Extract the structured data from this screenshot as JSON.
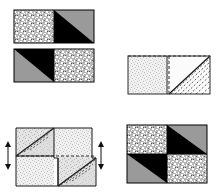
{
  "figure": {
    "background_color": "#ffffff",
    "colors": {
      "black": "#000000",
      "gray": "#9a9a9a",
      "speckle_base": "#c8c8c8",
      "speckle_dot": "#ffffff",
      "light_speckle_base": "#f2f2f2",
      "light_speckle_dot": "#c9c9c9",
      "light_gray_fill": "#dedede",
      "outline": "#000000",
      "light_outline": "#555555",
      "dashed": "#333333",
      "arrow": "#1a1a1a"
    },
    "panels": [
      {
        "id": "panel-top-left",
        "name": "solid-pieces-row",
        "label": "",
        "x": 14,
        "y": 10,
        "width": 80,
        "height": 76,
        "pieces": [
          {
            "id": "piece-a",
            "name": "rectangle-piece-a",
            "x": 14,
            "y": 10,
            "width": 80,
            "height": 33,
            "halves": [
              {
                "fill": "speckle",
                "position": "left"
              },
              {
                "fill": "gray-with-black-triangle",
                "triangle": "lower-left",
                "position": "right"
              }
            ]
          },
          {
            "id": "piece-b",
            "name": "rectangle-piece-b",
            "x": 14,
            "y": 49,
            "width": 80,
            "height": 33,
            "halves": [
              {
                "fill": "gray-with-black-triangle",
                "triangle": "upper-right",
                "position": "left"
              },
              {
                "fill": "speckle",
                "position": "right"
              }
            ]
          }
        ]
      },
      {
        "id": "panel-top-right",
        "name": "outline-construction",
        "label": "",
        "x": 128,
        "y": 56,
        "width": 82,
        "height": 38,
        "features": [
          "dashed-diagonal-hatching",
          "solid-diagonal",
          "vertical-midline"
        ]
      },
      {
        "id": "panel-bottom-left",
        "name": "shear-construction",
        "label": "",
        "x": 16,
        "y": 128,
        "width": 76,
        "height": 58,
        "features": [
          "dashed-diagonals",
          "solid-diagonals",
          "offset-step",
          "double-headed-arrows"
        ],
        "arrows": [
          {
            "id": "arrow-left",
            "name": "left-vertical-arrow",
            "x": 8,
            "y": 142,
            "height": 24,
            "direction": "double-vertical"
          },
          {
            "id": "arrow-right",
            "name": "right-vertical-arrow",
            "x": 98,
            "y": 142,
            "height": 24,
            "direction": "double-vertical"
          }
        ]
      },
      {
        "id": "panel-bottom-right",
        "name": "assembled-square",
        "label": "",
        "x": 127,
        "y": 125,
        "width": 80,
        "height": 58,
        "quadrants": [
          {
            "position": "top-left",
            "fill": "speckle"
          },
          {
            "position": "top-right",
            "fill": "gray-with-black-triangle",
            "triangle": "lower-left"
          },
          {
            "position": "bottom-left",
            "fill": "gray-with-black-triangle",
            "triangle": "upper-right"
          },
          {
            "position": "bottom-right",
            "fill": "speckle"
          }
        ]
      }
    ]
  }
}
